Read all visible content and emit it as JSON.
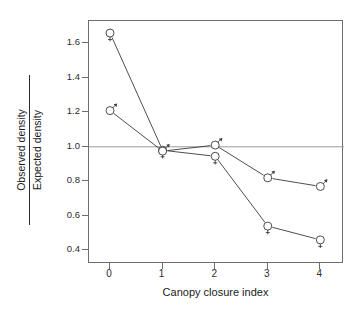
{
  "chart_data": {
    "type": "line",
    "title": "",
    "subtitle": "",
    "xlabel": "Canopy closure index",
    "ylabel_numerator": "Observed density",
    "ylabel_denominator": "Expected density",
    "ylabel": "Observed density / Expected density",
    "x": [
      0,
      1,
      2,
      3,
      4
    ],
    "xticklabels": [
      "0",
      "1",
      "2",
      "3",
      "4"
    ],
    "yticklabels": [
      "0.4",
      "0.6",
      "0.8",
      "1.0",
      "1.2",
      "1.4",
      "1.6"
    ],
    "yticks": [
      0.4,
      0.6,
      0.8,
      1.0,
      1.2,
      1.4,
      1.6
    ],
    "xlim": [
      -0.4,
      4.45
    ],
    "ylim": [
      0.32,
      1.73
    ],
    "grid": false,
    "legend": "none",
    "reference_line": {
      "orientation": "horizontal",
      "value": 1.0,
      "label": "1.0",
      "color": "#9a9a9a"
    },
    "series": [
      {
        "name": "Female",
        "marker": "venus-glyph",
        "marker_symbol": "♀",
        "color": "#3a3a3a",
        "values": [
          1.66,
          0.98,
          0.945,
          0.54,
          0.46
        ]
      },
      {
        "name": "Male",
        "marker": "mars-glyph",
        "marker_symbol": "♂",
        "color": "#3a3a3a",
        "values": [
          1.21,
          0.975,
          1.01,
          0.82,
          0.77
        ]
      }
    ],
    "axis_color": "#6e6e6e",
    "background": "#ffffff"
  }
}
